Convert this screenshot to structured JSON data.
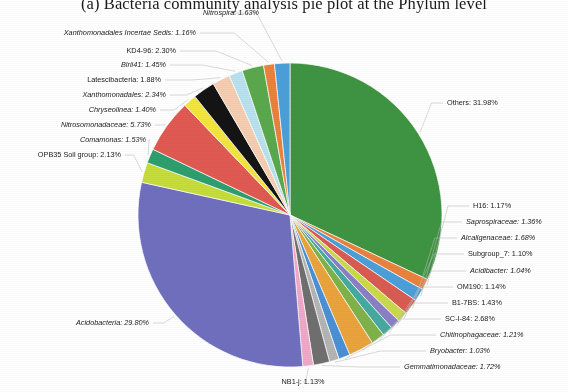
{
  "figure": {
    "title": "(a) Bacteria community analysis pie plot at the Phylum level",
    "background": "#ffffff"
  },
  "chart_data": {
    "type": "pie",
    "title": "(a) Bacteria community analysis pie plot at the Phylum level",
    "xlabel": "",
    "ylabel": "",
    "units": "percent",
    "label_format": "{name}: {value}%",
    "legend": "none",
    "grid": false,
    "center": [
      290,
      215
    ],
    "radius": 152,
    "start_angle_deg": -90,
    "direction": "clockwise",
    "total": 100.0,
    "categories": [
      "Others",
      "H16",
      "Saprospiraceae",
      "Alcaligenaceae",
      "Subgroup_7",
      "Acidibacter",
      "OM190",
      "B1-7BS",
      "SC-I-84",
      "Chitinophagaceae",
      "Bryobacter",
      "Gemmatimonadaceae",
      "NB1-j",
      "Acidobacteria",
      "OPB35 Soil group",
      "Comamonas",
      "Nitrosomonadaceae",
      "Chryseolinea",
      "Xanthomonadales",
      "Latescibacteria",
      "Blrii41",
      "KD4-96",
      "Xanthomonadales Incertae Sedis",
      "Nitrospira"
    ],
    "values": [
      31.98,
      1.17,
      1.36,
      1.68,
      1.1,
      1.04,
      1.14,
      1.43,
      2.68,
      1.21,
      1.03,
      1.72,
      1.13,
      29.8,
      2.13,
      1.53,
      5.73,
      1.4,
      2.34,
      1.88,
      1.45,
      2.3,
      1.16,
      1.63
    ],
    "colors": [
      "#3f9441",
      "#e8823c",
      "#4b9fd8",
      "#d85c52",
      "#c9d94a",
      "#8a7fc4",
      "#45a9a0",
      "#7fb24a",
      "#e8a33d",
      "#4b8fd4",
      "#b4b4b4",
      "#6f6f6f",
      "#f0a8c8",
      "#6f6fbe",
      "#c6dc3a",
      "#2f9e6e",
      "#e05a52",
      "#f2e53c",
      "#141414",
      "#f5cdb0",
      "#b9e2ee",
      "#5aa84d",
      "#e8823c",
      "#4b9fd8"
    ],
    "slices": [
      {
        "name": "Others",
        "value": 31.98,
        "color": "#3f9441",
        "italic": false
      },
      {
        "name": "H16",
        "value": 1.17,
        "color": "#e8823c",
        "italic": false
      },
      {
        "name": "Saprospiraceae",
        "value": 1.36,
        "color": "#4b9fd8",
        "italic": true
      },
      {
        "name": "Alcaligenaceae",
        "value": 1.68,
        "color": "#d85c52",
        "italic": true
      },
      {
        "name": "Subgroup_7",
        "value": 1.1,
        "color": "#c9d94a",
        "italic": false
      },
      {
        "name": "Acidibacter",
        "value": 1.04,
        "color": "#8a7fc4",
        "italic": true
      },
      {
        "name": "OM190",
        "value": 1.14,
        "color": "#45a9a0",
        "italic": false
      },
      {
        "name": "B1-7BS",
        "value": 1.43,
        "color": "#7fb24a",
        "italic": false
      },
      {
        "name": "SC-I-84",
        "value": 2.68,
        "color": "#e8a33d",
        "italic": false
      },
      {
        "name": "Chitinophagaceae",
        "value": 1.21,
        "color": "#4b8fd4",
        "italic": true
      },
      {
        "name": "Bryobacter",
        "value": 1.03,
        "color": "#b4b4b4",
        "italic": true
      },
      {
        "name": "Gemmatimonadaceae",
        "value": 1.72,
        "color": "#6f6f6f",
        "italic": true
      },
      {
        "name": "NB1-j",
        "value": 1.13,
        "color": "#f0a8c8",
        "italic": false
      },
      {
        "name": "Acidobacteria",
        "value": 29.8,
        "color": "#6f6fbe",
        "italic": true
      },
      {
        "name": "OPB35 Soil group",
        "value": 2.13,
        "color": "#c6dc3a",
        "italic": false
      },
      {
        "name": "Comamonas",
        "value": 1.53,
        "color": "#2f9e6e",
        "italic": true
      },
      {
        "name": "Nitrosomonadaceae",
        "value": 5.73,
        "color": "#e05a52",
        "italic": true
      },
      {
        "name": "Chryseolinea",
        "value": 1.4,
        "color": "#f2e53c",
        "italic": true
      },
      {
        "name": "Xanthomonadales",
        "value": 2.34,
        "color": "#141414",
        "italic": true
      },
      {
        "name": "Latescibacteria",
        "value": 1.88,
        "color": "#f5cdb0",
        "italic": false
      },
      {
        "name": "Blrii41",
        "value": 1.45,
        "color": "#b9e2ee",
        "italic": true
      },
      {
        "name": "KD4-96",
        "value": 2.3,
        "color": "#5aa84d",
        "italic": false
      },
      {
        "name": "Xanthomonadales Incertae Sedis",
        "value": 1.16,
        "color": "#e8823c",
        "italic": true
      },
      {
        "name": "Nitrospira",
        "value": 1.63,
        "color": "#4b9fd8",
        "italic": true
      }
    ],
    "annotations": [
      {
        "key": "nitrospira",
        "text": "Nitrospira: 1.63%",
        "x": 231,
        "y": 13,
        "align": "c",
        "italic": true
      },
      {
        "key": "xanth_incertae",
        "text": "Xanthomonadales Incertae Sedis: 1.16%",
        "x": 196,
        "y": 33,
        "align": "r",
        "italic": true
      },
      {
        "key": "kd4_96",
        "text": "KD4-96: 2.30%",
        "x": 176,
        "y": 51,
        "align": "r",
        "italic": false
      },
      {
        "key": "blrii41",
        "text": "Blrii41: 1.45%",
        "x": 166,
        "y": 65,
        "align": "r",
        "italic": true
      },
      {
        "key": "latescibacteria",
        "text": "Latescibacteria: 1.88%",
        "x": 161,
        "y": 80,
        "align": "r",
        "italic": false
      },
      {
        "key": "xanthomonadales",
        "text": "Xanthomonadales: 2.34%",
        "x": 166,
        "y": 95,
        "align": "r",
        "italic": true
      },
      {
        "key": "chryseolinea",
        "text": "Chryseolinea: 1.40%",
        "x": 156,
        "y": 110,
        "align": "r",
        "italic": true
      },
      {
        "key": "nitrosomonadaceae",
        "text": "Nitrosomonadaceae: 5.73%",
        "x": 151,
        "y": 125,
        "align": "r",
        "italic": true
      },
      {
        "key": "comamonas",
        "text": "Comamonas: 1.53%",
        "x": 146,
        "y": 140,
        "align": "r",
        "italic": true
      },
      {
        "key": "opb35",
        "text": "OPB35 Soil group: 2.13%",
        "x": 121,
        "y": 155,
        "align": "r",
        "italic": false
      },
      {
        "key": "acidobacteria",
        "text": "Acidobacteria: 29.80%",
        "x": 149,
        "y": 323,
        "align": "r",
        "italic": true
      },
      {
        "key": "nb1j",
        "text": "NB1-j: 1.13%",
        "x": 303,
        "y": 382,
        "align": "c",
        "italic": false
      },
      {
        "key": "others",
        "text": "Others: 31.98%",
        "x": 447,
        "y": 103,
        "align": "l",
        "italic": false
      },
      {
        "key": "h16",
        "text": "H16: 1.17%",
        "x": 473,
        "y": 206,
        "align": "l",
        "italic": false
      },
      {
        "key": "saprospiraceae",
        "text": "Saprospiraceae: 1.36%",
        "x": 466,
        "y": 222,
        "align": "l",
        "italic": true
      },
      {
        "key": "alcaligenaceae",
        "text": "Alcaligenaceae: 1.68%",
        "x": 461,
        "y": 238,
        "align": "l",
        "italic": true
      },
      {
        "key": "subgroup7",
        "text": "Subgroup_7: 1.10%",
        "x": 468,
        "y": 254,
        "align": "l",
        "italic": false
      },
      {
        "key": "acidibacter",
        "text": "Acidibacter: 1.04%",
        "x": 470,
        "y": 271,
        "align": "l",
        "italic": true
      },
      {
        "key": "om190",
        "text": "OM190: 1.14%",
        "x": 457,
        "y": 287,
        "align": "l",
        "italic": false
      },
      {
        "key": "b17bs",
        "text": "B1-7BS: 1.43%",
        "x": 452,
        "y": 303,
        "align": "l",
        "italic": false
      },
      {
        "key": "sci84",
        "text": "SC-I-84: 2.68%",
        "x": 445,
        "y": 319,
        "align": "l",
        "italic": false
      },
      {
        "key": "chitinophagaceae",
        "text": "Chitinophagaceae: 1.21%",
        "x": 440,
        "y": 335,
        "align": "l",
        "italic": true
      },
      {
        "key": "bryobacter",
        "text": "Bryobacter: 1.03%",
        "x": 430,
        "y": 351,
        "align": "l",
        "italic": true
      },
      {
        "key": "gemmatimonadaceae",
        "text": "Gemmatimonadaceae: 1.72%",
        "x": 404,
        "y": 367,
        "align": "l",
        "italic": true
      }
    ]
  }
}
